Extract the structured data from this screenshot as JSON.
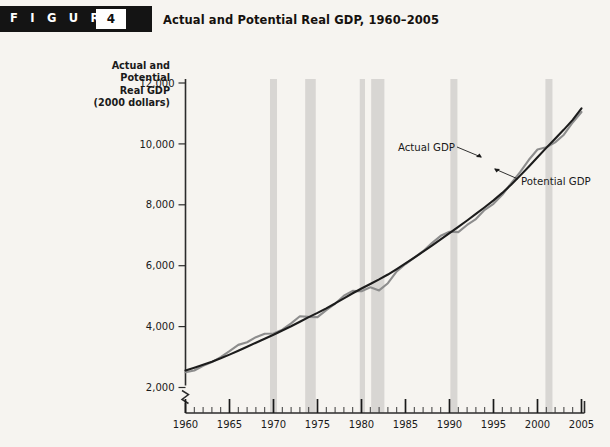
{
  "header": {
    "figure_word": "F I G U R E",
    "figure_number": "4",
    "title": "Actual and Potential Real GDP, 1960–2005"
  },
  "chart_data": {
    "type": "line",
    "title": "Actual and Potential Real GDP, 1960–2005",
    "ylabel_lines": [
      "Actual and",
      "Potential",
      "Real GDP",
      "(2000 dollars)"
    ],
    "ylabel": "Actual and Potential Real GDP (2000 dollars)",
    "xlabel": "",
    "xlim": [
      1960,
      2005
    ],
    "ylim": [
      2000,
      12000
    ],
    "yticks": [
      2000,
      4000,
      6000,
      8000,
      10000,
      12000
    ],
    "ytick_labels": [
      "2,000",
      "4,000",
      "6,000",
      "8,000",
      "10,000",
      "12,000"
    ],
    "xticks": [
      1960,
      1965,
      1970,
      1975,
      1980,
      1985,
      1990,
      1995,
      2000,
      2005
    ],
    "xtick_labels": [
      "1960",
      "1965",
      "1970",
      "1975",
      "1980",
      "1985",
      "1990",
      "1995",
      "2000",
      "2005"
    ],
    "x_minor_tick_step": 1,
    "y_axis_break": true,
    "grid": false,
    "legend": "annotations",
    "x": [
      1960,
      1961,
      1962,
      1963,
      1964,
      1965,
      1966,
      1967,
      1968,
      1969,
      1970,
      1971,
      1972,
      1973,
      1974,
      1975,
      1976,
      1977,
      1978,
      1979,
      1980,
      1981,
      1982,
      1983,
      1984,
      1985,
      1986,
      1987,
      1988,
      1989,
      1990,
      1991,
      1992,
      1993,
      1994,
      1995,
      1996,
      1997,
      1998,
      1999,
      2000,
      2001,
      2002,
      2003,
      2004,
      2005
    ],
    "series": [
      {
        "name": "Actual GDP",
        "color": "#8d8d8d",
        "values": [
          2502,
          2560,
          2715,
          2834,
          2999,
          3192,
          3400,
          3485,
          3652,
          3766,
          3772,
          3899,
          4105,
          4342,
          4320,
          4311,
          4541,
          4751,
          5015,
          5173,
          5162,
          5292,
          5189,
          5424,
          5814,
          6054,
          6264,
          6476,
          6743,
          6981,
          7113,
          7101,
          7337,
          7533,
          7836,
          8032,
          8329,
          8704,
          9067,
          9470,
          9817,
          9891,
          10049,
          10301,
          10704,
          11049
        ]
      },
      {
        "name": "Potential GDP",
        "color": "#1c1c1c",
        "values": [
          2560,
          2650,
          2745,
          2845,
          2958,
          3080,
          3208,
          3340,
          3470,
          3600,
          3730,
          3870,
          4010,
          4160,
          4310,
          4450,
          4600,
          4760,
          4930,
          5095,
          5250,
          5400,
          5550,
          5710,
          5890,
          6075,
          6265,
          6460,
          6660,
          6865,
          7070,
          7275,
          7485,
          7700,
          7920,
          8145,
          8390,
          8660,
          8950,
          9250,
          9560,
          9870,
          10170,
          10470,
          10790,
          11170
        ]
      }
    ],
    "recession_bands": [
      {
        "start": 1969.6,
        "end": 1970.4
      },
      {
        "start": 1973.6,
        "end": 1974.8
      },
      {
        "start": 1979.8,
        "end": 1980.4
      },
      {
        "start": 1981.1,
        "end": 1982.6
      },
      {
        "start": 1990.1,
        "end": 1990.9
      },
      {
        "start": 2000.9,
        "end": 2001.7
      }
    ],
    "annotations": [
      {
        "label": "Actual GDP",
        "x": 455,
        "y": 151
      },
      {
        "label": "Potential GDP",
        "x": 521,
        "y": 185
      }
    ],
    "colors": {
      "actual": "#8d8d8d",
      "potential": "#1c1c1c",
      "band": "#d8d6d3",
      "background": "#f6f4f0",
      "axis": "#2b2b2b"
    }
  }
}
